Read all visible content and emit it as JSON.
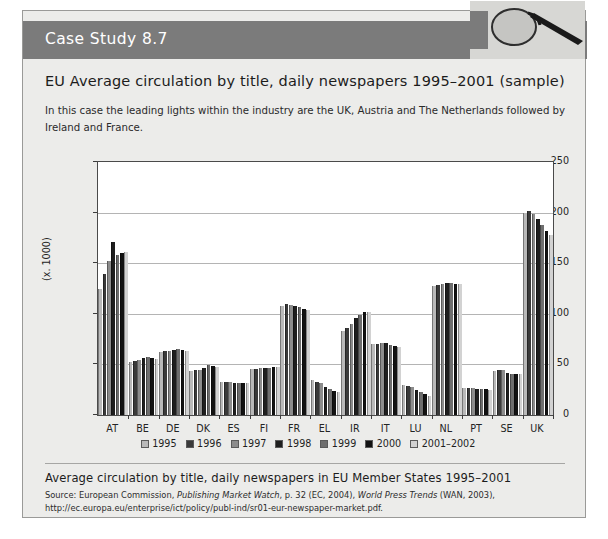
{
  "header": {
    "title": "Case Study 8.7",
    "icon": "magnifier-icon",
    "band_color": "#7b7b7b"
  },
  "chart_title": "EU Average circulation by title, daily newspapers 1995–2001 (sample)",
  "intro": "In this case the leading lights within the industry are the UK, Austria and The Netherlands followed by Ireland and France.",
  "caption": "Average circulation by title, daily newspapers in EU Member States 1995–2001",
  "source": {
    "prefix": "Source: European Commission, ",
    "italic1": "Publishing Market Watch",
    "mid": ", p. 32 (EC, 2004), ",
    "italic2": "World Press Trends",
    "suffix": " (WAN, 2003), http://ec.europa.eu/enterprise/ict/policy/publ-ind/sr01-eur-newspaper-market.pdf."
  },
  "chart_data": {
    "type": "bar",
    "title": "EU Average circulation by title, daily newspapers 1995–2001 (sample)",
    "xlabel": "",
    "ylabel": "(x. 1000)",
    "ylim": [
      0,
      250
    ],
    "yticks": [
      0,
      50,
      100,
      150,
      200,
      250
    ],
    "grid": true,
    "legend_position": "bottom",
    "categories": [
      "AT",
      "BE",
      "DE",
      "DK",
      "ES",
      "FI",
      "FR",
      "EL",
      "IR",
      "IT",
      "LU",
      "NL",
      "PT",
      "SE",
      "UK"
    ],
    "series": [
      {
        "name": "1995",
        "color": "#b9b9b9",
        "values": [
          125,
          52,
          62,
          43,
          33,
          45,
          108,
          35,
          83,
          70,
          30,
          127,
          27,
          43,
          200
        ]
      },
      {
        "name": "1996",
        "color": "#3a3a3a",
        "values": [
          139,
          53,
          63,
          44,
          33,
          45,
          110,
          33,
          86,
          70,
          29,
          128,
          27,
          44,
          202
        ]
      },
      {
        "name": "1997",
        "color": "#8c8c8c",
        "values": [
          152,
          54,
          63,
          44,
          33,
          46,
          109,
          32,
          90,
          71,
          28,
          129,
          27,
          44,
          199
        ]
      },
      {
        "name": "1998",
        "color": "#1e1e1e",
        "values": [
          171,
          56,
          64,
          46,
          32,
          46,
          108,
          28,
          96,
          71,
          25,
          130,
          26,
          42,
          194
        ]
      },
      {
        "name": "1999",
        "color": "#6e6e6e",
        "values": [
          158,
          57,
          65,
          49,
          32,
          46,
          107,
          26,
          99,
          69,
          23,
          130,
          26,
          41,
          188
        ]
      },
      {
        "name": "2000",
        "color": "#121212",
        "values": [
          160,
          56,
          64,
          48,
          32,
          47,
          105,
          24,
          102,
          68,
          21,
          129,
          26,
          41,
          182
        ]
      },
      {
        "name": "2001–2002",
        "color": "#d2d2d2",
        "values": [
          161,
          55,
          63,
          47,
          32,
          47,
          104,
          23,
          102,
          67,
          19,
          129,
          25,
          41,
          178
        ]
      }
    ]
  }
}
